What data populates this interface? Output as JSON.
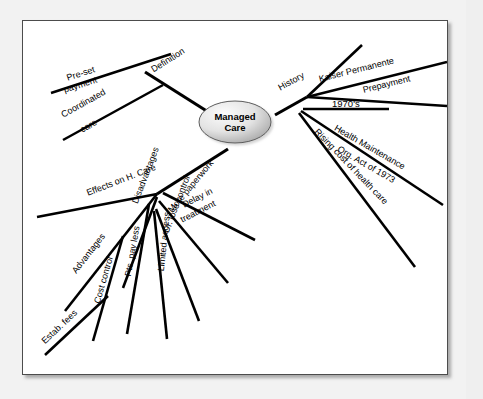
{
  "diagram": {
    "title": "Managed Care",
    "center": {
      "line1": "Managed",
      "line2": "Care"
    },
    "colors": {
      "canvas": "#f2f2f2",
      "panel": "#ffffff",
      "panel_border": "#4c4c4c",
      "branch": "#000000",
      "text": "#000000",
      "node_fill_light": "#f7f7f7",
      "node_fill_dark": "#a8a8a8"
    },
    "branches": [
      {
        "label": "Definition",
        "children": [
          {
            "label_line1": "Pre-set",
            "label_line2": "payment"
          },
          {
            "label_line1": "Coordinated",
            "label_line2": "care"
          }
        ]
      },
      {
        "label": "History",
        "children": [
          {
            "label_line1": "Kaiser Permanente"
          },
          {
            "label_line1": "Prepayment"
          },
          {
            "label_line1": "1970's"
          },
          {
            "label_line1": "Health Maintenance",
            "label_line2": "Org. Act of 1973"
          },
          {
            "label_line1": "Rising cost of health care"
          }
        ]
      },
      {
        "label": "Effects on H. Care",
        "children": [
          {
            "label_line1": "Advantages",
            "children": [
              {
                "label_line1": "Cost control",
                "children": [
                  {
                    "label_line1": "Estab. fees"
                  }
                ]
              },
              {
                "label_line1": "Pts. pay less"
              }
            ]
          },
          {
            "label_line1": "Disadvantages",
            "children": [
              {
                "label_line1": "Limited access"
              },
              {
                "label_line1": "Dr. lose control"
              },
              {
                "label_line1": "More paperwork"
              },
              {
                "label_line1": "Delay in",
                "label_line2": "treatment"
              }
            ]
          }
        ]
      }
    ]
  },
  "labels": {
    "definition": "Definition",
    "preset": "Pre-set",
    "payment": "payment",
    "coordinated": "Coordinated",
    "care": "care",
    "history": "History",
    "kaiser": "Kaiser Permanente",
    "prepayment": "Prepayment",
    "nineteen70s": "1970's",
    "hmo_line1": "Health Maintenance",
    "hmo_line2": "Org. Act of 1973",
    "rising_cost": "Rising cost of health care",
    "effects": "Effects on H. Care",
    "advantages": "Advantages",
    "cost_control": "Cost control",
    "estab_fees": "Estab. fees",
    "pts_pay_less": "Pts. pay less",
    "disadvantages": "Disadvantages",
    "limited_access": "Limited access",
    "dr_lose_control": "Dr. lose control",
    "more_paperwork": "More paperwork",
    "delay_line1": "Delay in",
    "delay_line2": "treatment"
  }
}
